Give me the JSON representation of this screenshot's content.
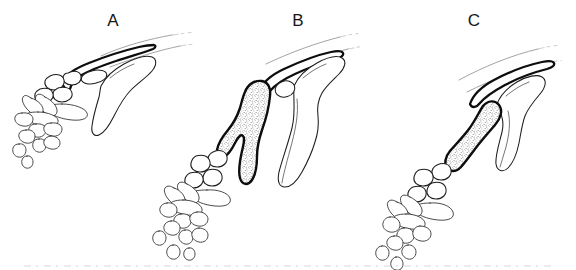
{
  "figure": {
    "background_color": "#ffffff",
    "ink_color": "#1a1a1a",
    "stipple_color": "#8a8a8a",
    "rib_color": "#8c8c8c",
    "width": 576,
    "height": 270,
    "panels": [
      {
        "id": "A",
        "label": "A",
        "label_x": 113,
        "label_y": 26,
        "has_stippled_bone": false,
        "parts": [
          "clavicle",
          "scapula",
          "glenoid",
          "carpals",
          "metacarpals",
          "phalanges"
        ]
      },
      {
        "id": "B",
        "label": "B",
        "label_x": 298,
        "label_y": 26,
        "has_stippled_bone": true,
        "stippled_bone_shape": "forked-branched",
        "parts": [
          "clavicle",
          "scapula",
          "glenoid",
          "stippled-element",
          "carpals",
          "metacarpals",
          "phalanges"
        ]
      },
      {
        "id": "C",
        "label": "C",
        "label_x": 474,
        "label_y": 26,
        "has_stippled_bone": true,
        "stippled_bone_shape": "elongate-dumbbell",
        "parts": [
          "clavicle",
          "scapula",
          "stippled-element",
          "carpals",
          "metacarpals",
          "phalanges"
        ]
      }
    ]
  }
}
